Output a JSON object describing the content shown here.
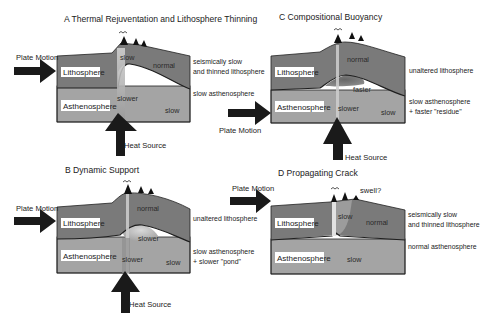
{
  "colors": {
    "lithosphere": "#7a7a7a",
    "asthenosphere": "#a4a4a4",
    "arrow": "#1a1a1a",
    "boundary": "#1e1e1e",
    "conduit": "#d8d8d8"
  },
  "panels": {
    "A": {
      "title": "A  Thermal Rejuventation and Lithosphere Thinning",
      "plate_motion": "Plate Motion",
      "litho_label": "Lithosphere",
      "astheno_label": "Asthenosphere",
      "zone_labels": [
        "slow",
        "normal",
        "slower",
        "slow"
      ],
      "heat_source": "Heat Source",
      "right_labels": [
        "seismically slow",
        "and thinned lithosphere",
        "slow asthenosphere"
      ]
    },
    "B": {
      "title": "B  Dynamic Support",
      "plate_motion": "Plate Motion",
      "litho_label": "Lithosphere",
      "astheno_label": "Asthenosphere",
      "zone_labels": [
        "normal",
        "slower",
        "slower",
        "slow"
      ],
      "heat_source": "Heat Source",
      "right_labels": [
        "unaltered lithosphere",
        "slow asthenosphere",
        "+ slower \"pond\""
      ]
    },
    "C": {
      "title": "C  Compositional Buoyancy",
      "plate_motion": "Plate Motion",
      "litho_label": "Lithosphere",
      "astheno_label": "Asthenosphere",
      "zone_labels": [
        "normal",
        "faster",
        "slower",
        "slow"
      ],
      "heat_source": "Heat Source",
      "right_labels": [
        "unaltered lithosphere",
        "slow asthenosphere",
        "+ faster \"residue\""
      ]
    },
    "D": {
      "title": "D  Propagating Crack",
      "plate_motion": "Plate Motion",
      "swell": "swell?",
      "litho_label": "Lithosphere",
      "astheno_label": "Asthenosphere",
      "zone_labels": [
        "slow",
        "normal",
        "slow"
      ],
      "right_labels": [
        "seismically slow",
        "and thinned lithosphere",
        "normal asthenosphere"
      ]
    }
  }
}
